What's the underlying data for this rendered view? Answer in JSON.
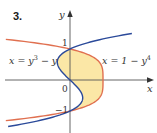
{
  "problem_number": "3.",
  "axes": {
    "x_label": "x",
    "y_label": "y",
    "origin_label": "0",
    "tick_labels": {
      "y_pos": "1",
      "y_neg": "−1"
    }
  },
  "curves": [
    {
      "name": "x = y^3 - y",
      "label_lhs": "x = y",
      "label_exp": "3",
      "label_rhs": " − y",
      "color": "#2b4a9a",
      "y_range": [
        -1.5,
        1.5
      ]
    },
    {
      "name": "x = 1 - y^4",
      "label_lhs": "x = 1 − y",
      "label_exp": "4",
      "label_rhs": "",
      "color": "#e07050",
      "y_range": [
        -1.31,
        1.31
      ]
    }
  ],
  "region": {
    "fill": "#fbe7a6",
    "between_y": [
      -1,
      1
    ]
  },
  "geometry": {
    "origin_px": [
      70,
      80
    ],
    "unit_x_px": 33,
    "unit_y_px": 31
  }
}
